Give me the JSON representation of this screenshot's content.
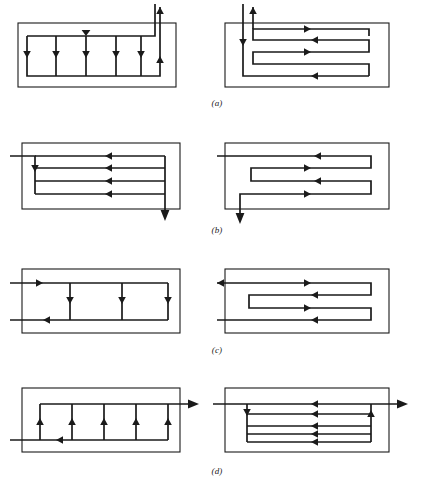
{
  "figure": {
    "background_color": "#ffffff",
    "line_color": "#1a1a1a",
    "width": 434,
    "height": 488,
    "bottom_partial_text": ""
  },
  "rows": [
    {
      "caption": "(a)",
      "caption_y": 98,
      "y": 2,
      "left": {
        "name": "cross-flow-baffled-exchanger-a-left",
        "description": "Shell with four downward tube passes, top header flowing right-to-left, outlet rising at right",
        "arrow_count": 6,
        "pass_count": 4,
        "inlet": "top-right-down",
        "outlet": "top-right-up"
      },
      "right": {
        "name": "serpentine-exchanger-a-right",
        "description": "Shell with four horizontal serpentine passes alternating left and right, inlet down at top-left, outlet up at top-left",
        "arrow_count": 6,
        "pass_count": 4,
        "inlet": "top-left-down",
        "outlet": "top-left-up"
      }
    },
    {
      "caption": "(b)",
      "caption_y": 228,
      "y": 125,
      "left": {
        "name": "parallel-flow-exchanger-b-left",
        "description": "Shell with four parallel horizontal passes all flowing left to right, inlet from left, outlet down at right",
        "arrow_count": 6,
        "pass_count": 4,
        "inlet": "left-horizontal",
        "outlet": "bottom-right-down"
      },
      "right": {
        "name": "serpentine-exchanger-b-right",
        "description": "Shell with four serpentine passes alternating direction, inlet from left at top, outlet down at bottom-left",
        "arrow_count": 5,
        "pass_count": 4,
        "inlet": "left-horizontal",
        "outlet": "bottom-left-down"
      }
    },
    {
      "caption": "(c)",
      "caption_y": 345,
      "y": 248,
      "left": {
        "name": "cross-flow-exchanger-c-left",
        "description": "Shell with three downward tube passes, inlet from left at top, outlet to left at bottom",
        "arrow_count": 5,
        "pass_count": 3,
        "inlet": "left-top-horizontal",
        "outlet": "left-bottom-horizontal"
      },
      "right": {
        "name": "serpentine-exchanger-c-right",
        "description": "Shell with four serpentine passes, inlet from left at bottom, outlet to left at top",
        "arrow_count": 5,
        "pass_count": 4,
        "inlet": "left-bottom-horizontal",
        "outlet": "left-top-horizontal"
      }
    },
    {
      "caption": "(d)",
      "caption_y": 465,
      "y": 376,
      "left": {
        "name": "cross-flow-exchanger-d-left",
        "description": "Shell with five upward tube passes, inlet from left at bottom, outlet to right at top",
        "arrow_count": 7,
        "pass_count": 5,
        "inlet": "left-bottom-horizontal",
        "outlet": "right-top-horizontal"
      },
      "right": {
        "name": "parallel-flow-exchanger-d-right",
        "description": "Shell with four parallel horizontal passes flowing left to right, inlet from left at top, outlet to right at top",
        "arrow_count": 6,
        "pass_count": 4,
        "inlet": "left-top-horizontal",
        "outlet": "right-top-horizontal"
      }
    }
  ]
}
